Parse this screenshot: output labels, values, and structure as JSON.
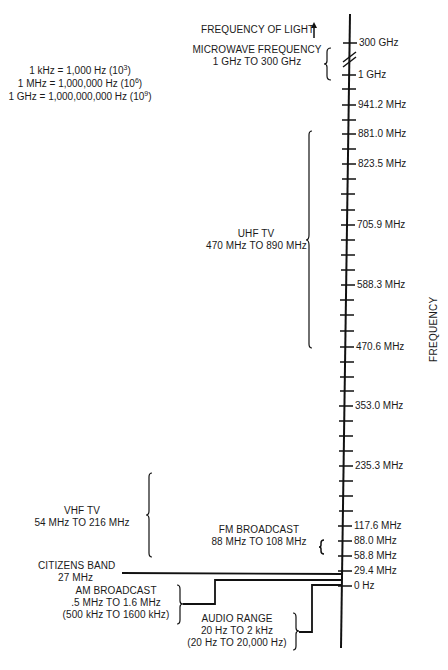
{
  "units": [
    {
      "text": "1 kHz = 1,000 Hz (10",
      "exp": "3",
      "close": ")"
    },
    {
      "text": "1 MHz = 1,000,000 Hz (10",
      "exp": "6",
      "close": ")"
    },
    {
      "text": "1 GHz = 1,000,000,000 Hz (10",
      "exp": "9",
      "close": ")"
    }
  ],
  "axis": {
    "title": "FREQUENCY",
    "top_label": "FREQUENCY OF LIGHT",
    "tick_labels": [
      {
        "label": "300 GHz",
        "y": 43
      },
      {
        "label": "1 GHz",
        "y": 75
      },
      {
        "label": "941.2 MHz",
        "y": 105
      },
      {
        "label": "881.0 MHz",
        "y": 134
      },
      {
        "label": "823.5 MHz",
        "y": 164
      },
      {
        "label": "705.9 MHz",
        "y": 225
      },
      {
        "label": "588.3 MHz",
        "y": 285
      },
      {
        "label": "470.6 MHz",
        "y": 347
      },
      {
        "label": "353.0 MHz",
        "y": 406
      },
      {
        "label": "235.3 MHz",
        "y": 466
      },
      {
        "label": "117.6 MHz",
        "y": 526
      },
      {
        "label": "88.0 MHz",
        "y": 541
      },
      {
        "label": "58.8 MHz",
        "y": 556
      },
      {
        "label": "29.4 MHz",
        "y": 571
      },
      {
        "label": "0 Hz",
        "y": 586
      }
    ]
  },
  "bands": {
    "microwave": {
      "name": "MICROWAVE FREQUENCY",
      "range": "1 GHz TO 300 GHz"
    },
    "uhf": {
      "name": "UHF TV",
      "range": "470 MHz TO 890 MHz"
    },
    "vhf": {
      "name": "VHF TV",
      "range": "54 MHz TO 216 MHz"
    },
    "fm": {
      "name": "FM BROADCAST",
      "range": "88 MHz TO 108 MHz"
    },
    "citizens": {
      "name": "CITIZENS BAND",
      "range": "27 MHz"
    },
    "am": {
      "name": "AM BROADCAST",
      "range": ".5 MHz TO 1.6 MHz",
      "alt": "(500 kHz TO 1600 kHz)"
    },
    "audio": {
      "name": "AUDIO RANGE",
      "range": "20 Hz TO 2 kHz",
      "alt": "(20 Hz TO 20,000 Hz)"
    }
  }
}
